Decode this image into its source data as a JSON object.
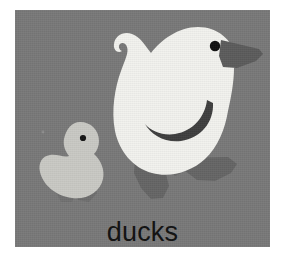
{
  "card": {
    "caption": "ducks",
    "background_color": "#787878",
    "page_background_color": "#ffffff"
  },
  "illustration": {
    "title": "two-ducks-illustration",
    "subjects": [
      {
        "name": "adult-duck",
        "body_color": "#f2f2ee",
        "beak_color": "#5a5a5a",
        "eye_color": "#111111",
        "wing_color": "#3f3f3f",
        "feet_color": "#636363"
      },
      {
        "name": "duckling",
        "body_color": "#c9c9c4",
        "eye_color": "#141414",
        "feet_color": "#6e6e6e"
      }
    ]
  }
}
